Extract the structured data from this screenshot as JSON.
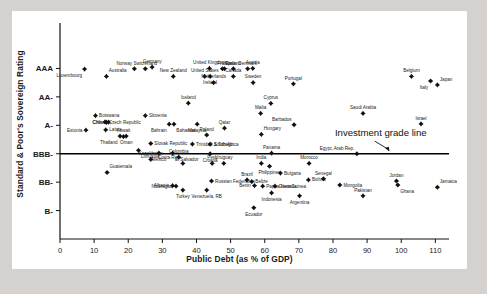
{
  "chart_data": {
    "type": "scatter",
    "title": "",
    "xlabel": "Public Debt (as % of GDP)",
    "ylabel": "Standard & Poor's Sovereign Rating",
    "xlim": [
      0,
      114
    ],
    "ylim": [
      0,
      7.6
    ],
    "grid": false,
    "legend": null,
    "xticks": [
      0,
      10,
      20,
      30,
      40,
      50,
      60,
      70,
      80,
      90,
      100,
      110
    ],
    "xticklabels": [
      "0",
      "10",
      "20",
      "30",
      "40",
      "50",
      "60",
      "70",
      "80",
      "90",
      "100",
      "110"
    ],
    "yticks": [
      1,
      2,
      3,
      4,
      5,
      6
    ],
    "yticklabels": [
      "B-",
      "BB-",
      "BBB-",
      "A-",
      "AA-",
      "AAA"
    ],
    "annotations": [
      {
        "text": "Investment grade line",
        "x": 94,
        "y": 3.62,
        "arrow_to_x": 96.5,
        "arrow_to_y": 3.08
      }
    ],
    "reference_lines": [
      {
        "orientation": "horizontal",
        "y": 3.0,
        "label": "Investment grade line",
        "color": "#000000"
      }
    ],
    "points": [
      {
        "label": "Luxembourg",
        "x": 7.2,
        "y": 5.98,
        "label_pos": "below-left"
      },
      {
        "label": "Australia",
        "x": 13.6,
        "y": 5.72,
        "label_pos": "above-right"
      },
      {
        "label": "Norway",
        "x": 21.8,
        "y": 5.99,
        "label_pos": "above-left"
      },
      {
        "label": "Switzerland",
        "x": 25.0,
        "y": 5.99,
        "label_pos": "above"
      },
      {
        "label": "Germany",
        "x": 27.0,
        "y": 6.05,
        "label_pos": "above"
      },
      {
        "label": "New Zealand",
        "x": 33.2,
        "y": 5.72,
        "label_pos": "above"
      },
      {
        "label": "United Kingdom",
        "x": 43.8,
        "y": 6.0,
        "label_pos": "above"
      },
      {
        "label": "United States",
        "x": 42.4,
        "y": 5.72,
        "label_pos": "above"
      },
      {
        "label": "Ireland",
        "x": 44.0,
        "y": 5.72,
        "label_pos": "below"
      },
      {
        "label": "France",
        "x": 48.2,
        "y": 5.99,
        "label_pos": "above"
      },
      {
        "label": "Spain",
        "x": 47.6,
        "y": 5.99,
        "label_pos": "above-right"
      },
      {
        "label": "Finland",
        "x": 50.8,
        "y": 5.99,
        "label_pos": "above"
      },
      {
        "label": "Denmark",
        "x": 55.0,
        "y": 5.99,
        "label_pos": "above"
      },
      {
        "label": "Canada",
        "x": 50.8,
        "y": 5.72,
        "label_pos": "above"
      },
      {
        "label": "Netherlands",
        "x": 45.0,
        "y": 5.5,
        "label_pos": "above"
      },
      {
        "label": "Austria",
        "x": 56.5,
        "y": 6.0,
        "label_pos": "above"
      },
      {
        "label": "Sweden",
        "x": 56.6,
        "y": 5.5,
        "label_pos": "above"
      },
      {
        "label": "Portugal",
        "x": 68.4,
        "y": 5.46,
        "label_pos": "above"
      },
      {
        "label": "Belgium",
        "x": 103.0,
        "y": 5.72,
        "label_pos": "above"
      },
      {
        "label": "Italy",
        "x": 108.6,
        "y": 5.56,
        "label_pos": "below-left"
      },
      {
        "label": "Japan",
        "x": 110.6,
        "y": 5.42,
        "label_pos": "above-right"
      },
      {
        "label": "Iceland",
        "x": 37.6,
        "y": 4.78,
        "label_pos": "above"
      },
      {
        "label": "Cyprus",
        "x": 61.8,
        "y": 4.77,
        "label_pos": "above"
      },
      {
        "label": "Malta",
        "x": 58.8,
        "y": 4.42,
        "label_pos": "above"
      },
      {
        "label": "Saudi Arabia",
        "x": 88.8,
        "y": 4.42,
        "label_pos": "above"
      },
      {
        "label": "Israel",
        "x": 105.8,
        "y": 4.05,
        "label_pos": "above"
      },
      {
        "label": "Botswana",
        "x": 10.4,
        "y": 4.34,
        "label_pos": "right"
      },
      {
        "label": "Czech Republic",
        "x": 13.2,
        "y": 4.12,
        "label_pos": "right"
      },
      {
        "label": "China",
        "x": 14.2,
        "y": 4.11,
        "label_pos": "left"
      },
      {
        "label": "Chile",
        "x": 13.6,
        "y": 4.1,
        "label_pos": "left"
      },
      {
        "label": "Slovenia",
        "x": 25.0,
        "y": 4.34,
        "label_pos": "right"
      },
      {
        "label": "Bahrain",
        "x": 32.0,
        "y": 4.04,
        "label_pos": "below-left"
      },
      {
        "label": "Bahamas",
        "x": 33.4,
        "y": 4.04,
        "label_pos": "below-right"
      },
      {
        "label": "Estonia",
        "x": 7.6,
        "y": 3.83,
        "label_pos": "left"
      },
      {
        "label": "Latvia",
        "x": 13.4,
        "y": 3.84,
        "label_pos": "right"
      },
      {
        "label": "Thailand",
        "x": 17.6,
        "y": 3.62,
        "label_pos": "below-left"
      },
      {
        "label": "Oman",
        "x": 19.4,
        "y": 3.62,
        "label_pos": "below"
      },
      {
        "label": "Kuwait",
        "x": 18.6,
        "y": 3.6,
        "label_pos": "above"
      },
      {
        "label": "Qatar",
        "x": 48.2,
        "y": 3.9,
        "label_pos": "above"
      },
      {
        "label": "Malaysia",
        "x": 40.2,
        "y": 4.04,
        "label_pos": "below"
      },
      {
        "label": "Poland",
        "x": 43.0,
        "y": 3.66,
        "label_pos": "above"
      },
      {
        "label": "Barbados",
        "x": 68.6,
        "y": 4.02,
        "label_pos": "above-left"
      },
      {
        "label": "Hungary",
        "x": 59.0,
        "y": 3.68,
        "label_pos": "above-right"
      },
      {
        "label": "Slovak Republic",
        "x": 26.6,
        "y": 3.36,
        "label_pos": "right"
      },
      {
        "label": "Trinidad & Tobago",
        "x": 38.8,
        "y": 3.34,
        "label_pos": "right"
      },
      {
        "label": "South Africa",
        "x": 44.0,
        "y": 3.34,
        "label_pos": "right"
      },
      {
        "label": "Lithuania",
        "x": 23.0,
        "y": 3.12,
        "label_pos": "below-right"
      },
      {
        "label": "Mexico",
        "x": 29.0,
        "y": 3.02,
        "label_pos": "below"
      },
      {
        "label": "El Salvador",
        "x": 33.0,
        "y": 3.02,
        "label_pos": "below-right"
      },
      {
        "label": "Croatia",
        "x": 44.0,
        "y": 3.0,
        "label_pos": "below"
      },
      {
        "label": "Panama",
        "x": 62.0,
        "y": 3.02,
        "label_pos": "above"
      },
      {
        "label": "Egypt, Arab Rep.",
        "x": 87.0,
        "y": 3.0,
        "label_pos": "above-left"
      },
      {
        "label": "Colombia",
        "x": 34.8,
        "y": 2.88,
        "label_pos": "above"
      },
      {
        "label": "Kazakhstan",
        "x": 26.6,
        "y": 2.8,
        "label_pos": "above"
      },
      {
        "label": "Costa Rica",
        "x": 36.0,
        "y": 2.66,
        "label_pos": "above-left"
      },
      {
        "label": "Peru",
        "x": 44.6,
        "y": 2.66,
        "label_pos": "above"
      },
      {
        "label": "Uruguay",
        "x": 48.0,
        "y": 2.66,
        "label_pos": "above"
      },
      {
        "label": "India",
        "x": 59.0,
        "y": 2.66,
        "label_pos": "above"
      },
      {
        "label": "Morocco",
        "x": 73.0,
        "y": 2.66,
        "label_pos": "above"
      },
      {
        "label": "Guatemala",
        "x": 13.8,
        "y": 2.34,
        "label_pos": "above-right"
      },
      {
        "label": "Philippines",
        "x": 61.4,
        "y": 2.56,
        "label_pos": "below"
      },
      {
        "label": "Bulgaria",
        "x": 64.6,
        "y": 2.32,
        "label_pos": "right"
      },
      {
        "label": "Brazil",
        "x": 54.8,
        "y": 2.08,
        "label_pos": "above"
      },
      {
        "label": "Russian Federation",
        "x": 44.4,
        "y": 2.04,
        "label_pos": "right"
      },
      {
        "label": "Belize",
        "x": 56.2,
        "y": 2.02,
        "label_pos": "right"
      },
      {
        "label": "Bolivia",
        "x": 72.8,
        "y": 2.08,
        "label_pos": "right"
      },
      {
        "label": "Senegal",
        "x": 77.2,
        "y": 2.12,
        "label_pos": "above"
      },
      {
        "label": "Mongolia",
        "x": 82.0,
        "y": 1.9,
        "label_pos": "right"
      },
      {
        "label": "Jordan",
        "x": 98.6,
        "y": 2.04,
        "label_pos": "above"
      },
      {
        "label": "Ghana",
        "x": 99.0,
        "y": 1.9,
        "label_pos": "below-right"
      },
      {
        "label": "Jamaica",
        "x": 110.6,
        "y": 1.82,
        "label_pos": "above-right"
      },
      {
        "label": "Albania",
        "x": 33.0,
        "y": 1.88,
        "label_pos": "left"
      },
      {
        "label": "Nicaragua",
        "x": 34.0,
        "y": 1.86,
        "label_pos": "left"
      },
      {
        "label": "Turkey",
        "x": 36.0,
        "y": 1.72,
        "label_pos": "below"
      },
      {
        "label": "Venezuela, RB",
        "x": 43.0,
        "y": 1.72,
        "label_pos": "below"
      },
      {
        "label": "Benin",
        "x": 57.0,
        "y": 1.88,
        "label_pos": "left"
      },
      {
        "label": "Papua New Guinea",
        "x": 59.4,
        "y": 1.86,
        "label_pos": "right"
      },
      {
        "label": "Grenada",
        "x": 63.0,
        "y": 1.86,
        "label_pos": "right"
      },
      {
        "label": "Indonesia",
        "x": 62.0,
        "y": 1.62,
        "label_pos": "below"
      },
      {
        "label": "Argentina",
        "x": 70.2,
        "y": 1.52,
        "label_pos": "below"
      },
      {
        "label": "Pakistan",
        "x": 88.8,
        "y": 1.52,
        "label_pos": "above"
      },
      {
        "label": "Ecuador",
        "x": 56.8,
        "y": 1.1,
        "label_pos": "below"
      }
    ]
  },
  "axes": {
    "x_axis_name": "public-debt-axis",
    "y_axis_name": "sovereign-rating-axis"
  }
}
